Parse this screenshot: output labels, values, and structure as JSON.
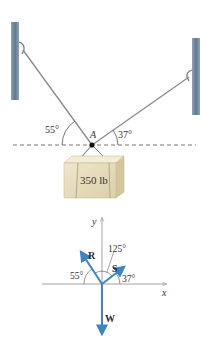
{
  "figure": {
    "top_diagram": {
      "point_label": "A",
      "left_angle": "55°",
      "right_angle": "37°",
      "load_label": "350 lb"
    },
    "free_body_diagram": {
      "x_axis_label": "x",
      "y_axis_label": "y",
      "vectors": [
        {
          "name": "R",
          "label": "R"
        },
        {
          "name": "S",
          "label": "S"
        },
        {
          "name": "W",
          "label": "W"
        }
      ],
      "angles": {
        "r_angle": "55°",
        "s_angle": "37°",
        "between_angle": "125°"
      }
    },
    "colors": {
      "vector": "#3d85c6",
      "wall": "#6f8aa3",
      "rope": "#8a8a8a",
      "box": "#e6dcbf",
      "axis": "#999999"
    }
  }
}
